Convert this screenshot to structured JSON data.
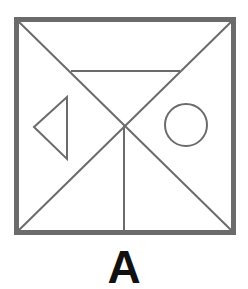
{
  "figure": {
    "label": "A",
    "colors": {
      "stroke": "#6b6b6b",
      "label": "#111111",
      "background": "#ffffff"
    },
    "frame": {
      "x": 16.5,
      "y": 19.5,
      "width": 217,
      "height": 213,
      "stroke_width": 5
    },
    "lines": [
      {
        "name": "diagonal-top-left-to-bottom-right",
        "x1": 19,
        "y1": 22,
        "x2": 231,
        "y2": 230
      },
      {
        "name": "diagonal-top-right-to-bottom-left",
        "x1": 231,
        "y1": 22,
        "x2": 19,
        "y2": 230
      },
      {
        "name": "horizontal-top-line",
        "x1": 71,
        "y1": 71,
        "x2": 180,
        "y2": 71
      },
      {
        "name": "vertical-center-line",
        "x1": 124,
        "y1": 125,
        "x2": 124,
        "y2": 230
      }
    ],
    "triangle": {
      "points": "34,127 67,97 67,159"
    },
    "circle": {
      "cx": 186,
      "cy": 125,
      "r": 21
    }
  }
}
